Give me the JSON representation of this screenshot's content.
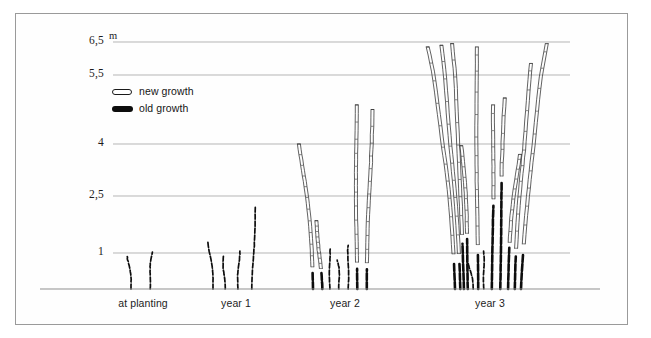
{
  "figure": {
    "unit_label": "m",
    "background_color": "#fefefe",
    "frame_color": "#9a9a9a",
    "gridline_color": "#b5b5b5",
    "baseline_color": "#8f8f8f",
    "old_growth_color": "#0d0d0d",
    "new_growth_color": "#3a3a3a"
  },
  "legend": {
    "position": "inside-upper-left",
    "items": [
      {
        "key": "new_growth",
        "label": "new growth",
        "style": "outlined",
        "color": "#ffffff",
        "border_color": "#1a1a1a"
      },
      {
        "key": "old_growth",
        "label": "old growth",
        "style": "solid",
        "color": "#0d0d0d",
        "border_color": "#0d0d0d"
      }
    ]
  },
  "chart_data": {
    "type": "line",
    "title": "",
    "subtitle": "",
    "xlabel": "",
    "ylabel": "m",
    "grid": true,
    "ylim": [
      0,
      7.0
    ],
    "yticks": [
      1,
      2.5,
      4,
      5.5,
      6.5
    ],
    "ytick_labels": [
      "1",
      "2,5",
      "4",
      "5,5",
      "6,5"
    ],
    "categories": [
      "at planting",
      "year 1",
      "year 2",
      "year 3"
    ],
    "legend_entries": [
      "new growth",
      "old growth"
    ],
    "annotations": [
      "Cane growth of a cane fruit over three seasons; dark segments are old growth, outlined segments are new growth."
    ],
    "series": [
      {
        "name": "at planting",
        "category_index": 0,
        "x_center_px": 143,
        "cane_count": 2,
        "canes": [
          {
            "base_x_px": 131,
            "top_x_px": 128,
            "old_growth_height_m": 0.95,
            "new_growth_height_m": 0.0,
            "total_height_m": 0.95
          },
          {
            "base_x_px": 150,
            "top_x_px": 152,
            "old_growth_height_m": 1.02,
            "new_growth_height_m": 0.0,
            "total_height_m": 1.02
          }
        ]
      },
      {
        "name": "year 1",
        "category_index": 1,
        "x_center_px": 236,
        "cane_count": 4,
        "canes": [
          {
            "base_x_px": 213,
            "top_x_px": 209,
            "old_growth_height_m": 1.28,
            "new_growth_height_m": 0.0,
            "total_height_m": 1.28
          },
          {
            "base_x_px": 225,
            "top_x_px": 223,
            "old_growth_height_m": 0.95,
            "new_growth_height_m": 0.0,
            "total_height_m": 0.95
          },
          {
            "base_x_px": 238,
            "top_x_px": 239,
            "old_growth_height_m": 1.05,
            "new_growth_height_m": 0.0,
            "total_height_m": 1.05
          },
          {
            "base_x_px": 252,
            "top_x_px": 256,
            "old_growth_height_m": 2.2,
            "new_growth_height_m": 0.0,
            "total_height_m": 2.2
          }
        ]
      },
      {
        "name": "year 2",
        "category_index": 2,
        "x_center_px": 345,
        "cane_count": 7,
        "canes": [
          {
            "base_x_px": 313,
            "top_x_px": 300,
            "old_growth_height_m": 0.55,
            "new_growth_height_m": 3.45,
            "total_height_m": 4.0
          },
          {
            "base_x_px": 322,
            "top_x_px": 316,
            "old_growth_height_m": 0.5,
            "new_growth_height_m": 1.35,
            "total_height_m": 1.85
          },
          {
            "base_x_px": 330,
            "top_x_px": 329,
            "old_growth_height_m": 1.15,
            "new_growth_height_m": 0.0,
            "total_height_m": 1.15
          },
          {
            "base_x_px": 339,
            "top_x_px": 338,
            "old_growth_height_m": 0.8,
            "new_growth_height_m": 0.0,
            "total_height_m": 0.8
          },
          {
            "base_x_px": 348,
            "top_x_px": 349,
            "old_growth_height_m": 1.2,
            "new_growth_height_m": 0.0,
            "total_height_m": 1.2
          },
          {
            "base_x_px": 357,
            "top_x_px": 356,
            "old_growth_height_m": 0.6,
            "new_growth_height_m": 4.25,
            "total_height_m": 4.85
          },
          {
            "base_x_px": 367,
            "top_x_px": 372,
            "old_growth_height_m": 0.6,
            "new_growth_height_m": 4.15,
            "total_height_m": 4.75
          }
        ]
      },
      {
        "name": "year 3",
        "category_index": 3,
        "x_center_px": 490,
        "cane_count": 12,
        "canes": [
          {
            "base_x_px": 455,
            "top_x_px": 429,
            "old_growth_height_m": 0.9,
            "new_growth_height_m": 5.45,
            "total_height_m": 6.35
          },
          {
            "base_x_px": 460,
            "top_x_px": 441,
            "old_growth_height_m": 0.95,
            "new_growth_height_m": 5.45,
            "total_height_m": 6.4
          },
          {
            "base_x_px": 464,
            "top_x_px": 451,
            "old_growth_height_m": 1.3,
            "new_growth_height_m": 5.15,
            "total_height_m": 6.45
          },
          {
            "base_x_px": 468,
            "top_x_px": 462,
            "old_growth_height_m": 1.5,
            "new_growth_height_m": 2.45,
            "total_height_m": 3.95
          },
          {
            "base_x_px": 473,
            "top_x_px": 469,
            "old_growth_height_m": 0.75,
            "new_growth_height_m": 0.0,
            "total_height_m": 0.75
          },
          {
            "base_x_px": 478,
            "top_x_px": 476,
            "old_growth_height_m": 1.1,
            "new_growth_height_m": 5.25,
            "total_height_m": 6.35
          },
          {
            "base_x_px": 484,
            "top_x_px": 483,
            "old_growth_height_m": 1.05,
            "new_growth_height_m": 0.0,
            "total_height_m": 1.05
          },
          {
            "base_x_px": 492,
            "top_x_px": 494,
            "old_growth_height_m": 2.4,
            "new_growth_height_m": 2.45,
            "total_height_m": 4.85
          },
          {
            "base_x_px": 500,
            "top_x_px": 505,
            "old_growth_height_m": 2.9,
            "new_growth_height_m": 2.1,
            "total_height_m": 5.0
          },
          {
            "base_x_px": 508,
            "top_x_px": 519,
            "old_growth_height_m": 1.15,
            "new_growth_height_m": 2.55,
            "total_height_m": 3.7
          },
          {
            "base_x_px": 515,
            "top_x_px": 531,
            "old_growth_height_m": 1.1,
            "new_growth_height_m": 4.75,
            "total_height_m": 5.85
          },
          {
            "base_x_px": 521,
            "top_x_px": 548,
            "old_growth_height_m": 1.05,
            "new_growth_height_m": 5.4,
            "total_height_m": 6.45
          }
        ]
      }
    ]
  }
}
